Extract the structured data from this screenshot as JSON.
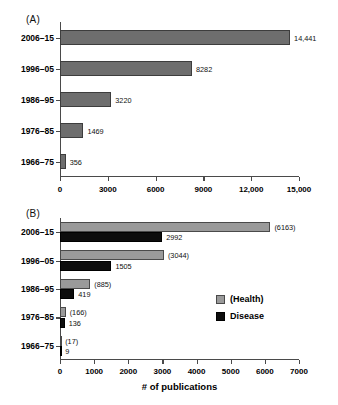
{
  "panels": {
    "a": {
      "tag": "(A)"
    },
    "b": {
      "tag": "(B)"
    }
  },
  "legend": {
    "health_label": "(Health)",
    "disease_label": "Disease",
    "health_color": "#9a9a9a",
    "disease_color": "#0d0d0d"
  },
  "chart_data": [
    {
      "type": "bar",
      "panel": "A",
      "title": "(A)",
      "orientation": "horizontal",
      "categories": [
        "1966–75",
        "1976–85",
        "1986–95",
        "1996–05",
        "2006–15"
      ],
      "values": [
        356,
        1469,
        3220,
        8282,
        14441
      ],
      "data_labels": [
        "356",
        "1469",
        "3220",
        "8282",
        "14,441"
      ],
      "series": [
        {
          "name": "Publications",
          "values": [
            356,
            1469,
            3220,
            8282,
            14441
          ],
          "color": "#6e6e6e"
        }
      ],
      "xlabel": "",
      "ylabel": "",
      "xlim": [
        0,
        15000
      ],
      "xticks": [
        0,
        3000,
        6000,
        9000,
        12000,
        15000
      ],
      "xtick_labels": [
        "0",
        "3000",
        "6000",
        "9000",
        "12,000",
        "15,000"
      ],
      "grid": false,
      "legend_position": "none"
    },
    {
      "type": "bar",
      "panel": "B",
      "title": "(B)",
      "orientation": "horizontal",
      "grouped": true,
      "categories": [
        "1966–75",
        "1976–85",
        "1986–95",
        "1996–05",
        "2006–15"
      ],
      "series": [
        {
          "name": "(Health)",
          "color": "#9a9a9a",
          "values": [
            17,
            166,
            885,
            3044,
            6163
          ],
          "data_labels": [
            "(17)",
            "(166)",
            "(885)",
            "(3044)",
            "(6163)"
          ]
        },
        {
          "name": "Disease",
          "color": "#0d0d0d",
          "values": [
            9,
            136,
            419,
            1505,
            2992
          ],
          "data_labels": [
            "9",
            "136",
            "419",
            "1505",
            "2992"
          ]
        }
      ],
      "xlabel": "# of publications",
      "ylabel": "",
      "xlim": [
        0,
        7000
      ],
      "xticks": [
        0,
        1000,
        2000,
        3000,
        4000,
        5000,
        6000,
        7000
      ],
      "xtick_labels": [
        "0",
        "1000",
        "2000",
        "3000",
        "4000",
        "5000",
        "6000",
        "7000"
      ],
      "grid": false,
      "legend_position": "right"
    }
  ]
}
